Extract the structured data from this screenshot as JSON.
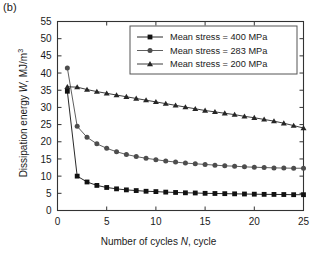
{
  "panel": {
    "label": "(b)"
  },
  "axes": {
    "xlabel_pre": "Number of cycles ",
    "xlabel_var": "N",
    "xlabel_post": ", cycle",
    "ylabel_pre": "Dissipation energy ",
    "ylabel_var": "W",
    "ylabel_post": ", MJ/m",
    "ylabel_sup": "3",
    "xticks": [
      "0",
      "5",
      "10",
      "15",
      "20",
      "25"
    ],
    "yticks": [
      "0",
      "5",
      "10",
      "15",
      "20",
      "25",
      "30",
      "35",
      "40",
      "45",
      "50",
      "55"
    ]
  },
  "legend": {
    "entries": [
      {
        "label": "Mean stress = 400 MPa",
        "marker": "square"
      },
      {
        "label": "Mean stress = 283 MPa",
        "marker": "circle"
      },
      {
        "label": "Mean stress = 200 MPa",
        "marker": "triangle"
      }
    ]
  },
  "colors": {
    "axis": "#333333",
    "series_400": "#111111",
    "series_283": "#4d4d4d",
    "series_200": "#262626",
    "legend_border": "#555555",
    "background": "#ffffff"
  },
  "chart_data": {
    "type": "line",
    "title": "",
    "xlabel": "Number of cycles N, cycle",
    "ylabel": "Dissipation energy W, MJ/m^3",
    "xlim": [
      0,
      25
    ],
    "ylim": [
      0,
      55
    ],
    "xticks": [
      0,
      5,
      10,
      15,
      20,
      25
    ],
    "yticks": [
      0,
      5,
      10,
      15,
      20,
      25,
      30,
      35,
      40,
      45,
      50,
      55
    ],
    "grid": false,
    "legend_position": "upper right",
    "x": [
      1,
      2,
      3,
      4,
      5,
      6,
      7,
      8,
      9,
      10,
      11,
      12,
      13,
      14,
      15,
      16,
      17,
      18,
      19,
      20,
      21,
      22,
      23,
      24,
      25
    ],
    "series": [
      {
        "name": "Mean stress = 400 MPa",
        "marker": "square",
        "values": [
          34.7,
          10.0,
          8.3,
          7.3,
          6.7,
          6.3,
          6.0,
          5.8,
          5.6,
          5.5,
          5.35,
          5.25,
          5.15,
          5.1,
          5.0,
          4.95,
          4.9,
          4.85,
          4.8,
          4.75,
          4.7,
          4.68,
          4.65,
          4.6,
          4.6
        ]
      },
      {
        "name": "Mean stress = 283 MPa",
        "marker": "circle",
        "values": [
          41.5,
          24.5,
          21.3,
          19.4,
          18.1,
          17.1,
          16.3,
          15.7,
          15.2,
          14.8,
          14.4,
          14.1,
          13.8,
          13.6,
          13.4,
          13.2,
          13.0,
          12.9,
          12.7,
          12.6,
          12.5,
          12.4,
          12.35,
          12.3,
          12.3
        ]
      },
      {
        "name": "Mean stress = 200 MPa",
        "marker": "triangle",
        "values": [
          36.0,
          35.9,
          35.2,
          34.6,
          34.1,
          33.6,
          33.1,
          32.6,
          32.1,
          31.6,
          31.1,
          30.6,
          30.1,
          29.6,
          29.1,
          28.7,
          28.3,
          27.9,
          27.4,
          27.0,
          26.5,
          26.0,
          25.4,
          24.7,
          24.0
        ]
      }
    ]
  }
}
